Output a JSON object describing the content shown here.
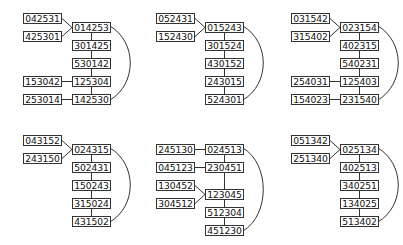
{
  "diagram": {
    "panels": [
      {
        "id": "panel-1",
        "main_chain": [
          "014253",
          "301425",
          "530142",
          "125304",
          "142530"
        ],
        "side_nodes": [
          {
            "label": "042531",
            "row": -0.5,
            "attach": 0,
            "style": "diag"
          },
          {
            "label": "425301",
            "row": 0.5,
            "attach": 0,
            "style": "diag"
          },
          {
            "label": "153042",
            "row": 3,
            "attach": 3,
            "style": "straight"
          },
          {
            "label": "253014",
            "row": 4,
            "attach": 4,
            "style": "straight"
          }
        ],
        "arc": {
          "from": 0,
          "to": 4
        }
      },
      {
        "id": "panel-2",
        "main_chain": [
          "015243",
          "301524",
          "430152",
          "243015",
          "524301"
        ],
        "side_nodes": [
          {
            "label": "052431",
            "row": -0.5,
            "attach": 0,
            "style": "diag"
          },
          {
            "label": "152430",
            "row": 0.5,
            "attach": 0,
            "style": "diag"
          }
        ],
        "arc": {
          "from": 0,
          "to": 4
        }
      },
      {
        "id": "panel-3",
        "main_chain": [
          "023154",
          "402315",
          "540231",
          "125403",
          "231540"
        ],
        "side_nodes": [
          {
            "label": "031542",
            "row": -0.5,
            "attach": 0,
            "style": "diag"
          },
          {
            "label": "315402",
            "row": 0.5,
            "attach": 0,
            "style": "diag"
          },
          {
            "label": "254031",
            "row": 3,
            "attach": 3,
            "style": "straight"
          },
          {
            "label": "154023",
            "row": 4,
            "attach": 4,
            "style": "straight"
          }
        ],
        "arc": {
          "from": 0,
          "to": 4
        }
      },
      {
        "id": "panel-4",
        "main_chain": [
          "024315",
          "502431",
          "150243",
          "315024",
          "431502"
        ],
        "side_nodes": [
          {
            "label": "043152",
            "row": -0.5,
            "attach": 0,
            "style": "diag"
          },
          {
            "label": "243150",
            "row": 0.5,
            "attach": 0,
            "style": "diag"
          }
        ],
        "arc": {
          "from": 0,
          "to": 4
        }
      },
      {
        "id": "panel-5",
        "main_chain": [
          "024513",
          "230451",
          "123045",
          "512304",
          "451230"
        ],
        "main_rows": [
          0,
          1,
          2.5,
          3.5,
          4.5
        ],
        "side_nodes": [
          {
            "label": "245130",
            "row": 0,
            "attach": 0,
            "style": "straight"
          },
          {
            "label": "045123",
            "row": 1,
            "attach": 1,
            "style": "straight"
          },
          {
            "label": "130452",
            "row": 2,
            "attach": 2,
            "style": "diag"
          },
          {
            "label": "304512",
            "row": 3,
            "attach": 2,
            "style": "diag"
          }
        ],
        "arc": {
          "from": 0,
          "to": 4
        }
      },
      {
        "id": "panel-6",
        "main_chain": [
          "025134",
          "402513",
          "340251",
          "134025",
          "513402"
        ],
        "side_nodes": [
          {
            "label": "051342",
            "row": -0.5,
            "attach": 0,
            "style": "diag"
          },
          {
            "label": "251340",
            "row": 0.5,
            "attach": 0,
            "style": "diag"
          }
        ],
        "arc": {
          "from": 0,
          "to": 4
        }
      }
    ]
  }
}
